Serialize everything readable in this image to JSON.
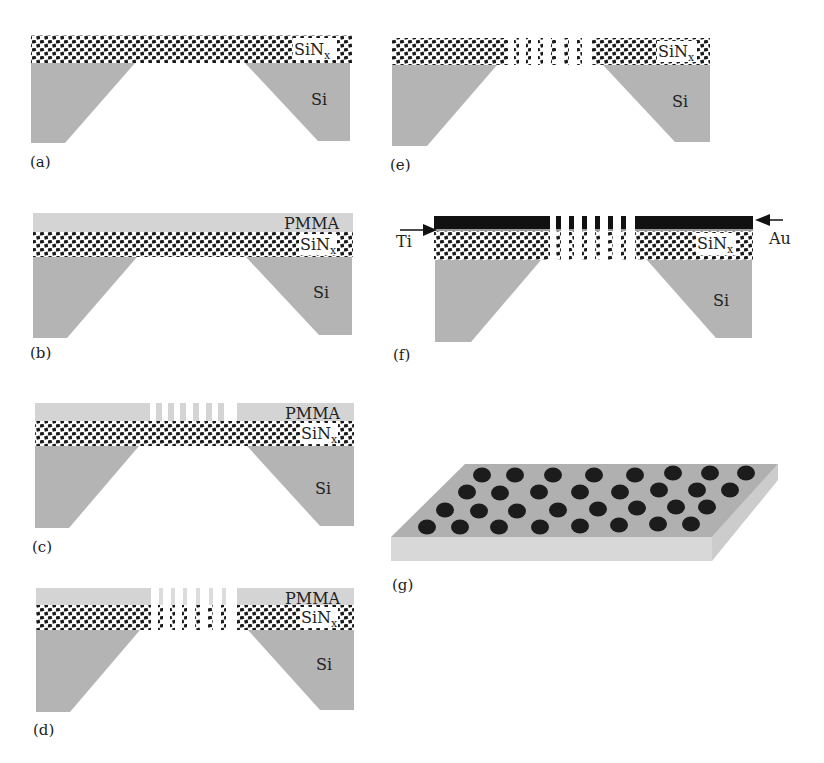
{
  "figure": {
    "colors": {
      "si": "#b4b4b4",
      "pmma": "#d4d4d4",
      "sinx_dots": "#1a1a1a",
      "au": "#111111",
      "slab_top": "#b0b0b0",
      "slab_side": "#d8d8d8",
      "hole": "#1c1c1c"
    },
    "materials": {
      "sinx": "SiN",
      "sinx_sub": "x",
      "si": "Si",
      "pmma": "PMMA",
      "ti": "Ti",
      "au": "Au"
    },
    "panels": [
      {
        "id": "a",
        "label": "(a)",
        "layers": [
          "Si",
          "SiNx"
        ]
      },
      {
        "id": "b",
        "label": "(b)",
        "layers": [
          "Si",
          "SiNx",
          "PMMA"
        ]
      },
      {
        "id": "c",
        "label": "(c)",
        "layers": [
          "Si",
          "SiNx",
          "PMMA (patterned)"
        ]
      },
      {
        "id": "d",
        "label": "(d)",
        "layers": [
          "Si",
          "SiNx (etched)",
          "PMMA (patterned)"
        ]
      },
      {
        "id": "e",
        "label": "(e)",
        "layers": [
          "Si",
          "SiNx (etched)"
        ]
      },
      {
        "id": "f",
        "label": "(f)",
        "layers": [
          "Si",
          "SiNx (etched)",
          "Ti",
          "Au"
        ]
      },
      {
        "id": "g",
        "label": "(g)",
        "layers": [
          "Nanohole array (perspective)"
        ]
      }
    ]
  }
}
